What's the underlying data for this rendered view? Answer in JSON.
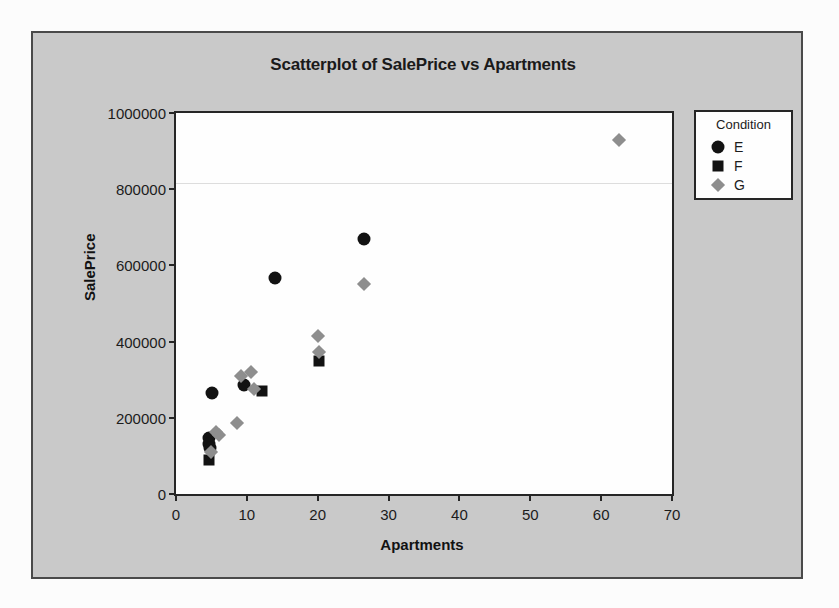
{
  "chart_data": {
    "type": "scatter",
    "title": "Scatterplot of SalePrice vs Apartments",
    "xlabel": "Apartments",
    "ylabel": "SalePrice",
    "xlim": [
      0,
      70
    ],
    "ylim": [
      0,
      1000000
    ],
    "xticks": [
      0,
      10,
      20,
      30,
      40,
      50,
      60,
      70
    ],
    "yticks": [
      0,
      200000,
      400000,
      600000,
      800000,
      1000000
    ],
    "xtick_labels": [
      "0",
      "10",
      "20",
      "30",
      "40",
      "50",
      "60",
      "70"
    ],
    "ytick_labels": [
      "0",
      "200000",
      "400000",
      "600000",
      "800000",
      "1000000"
    ],
    "grid": false,
    "legend_position": "right-outside",
    "legend_title": "Condition",
    "series": [
      {
        "name": "E",
        "marker": "circle",
        "color": "#121212",
        "points": [
          {
            "x": 4.6,
            "y": 148000
          },
          {
            "x": 4.7,
            "y": 132000
          },
          {
            "x": 4.8,
            "y": 120000
          },
          {
            "x": 5.1,
            "y": 265000
          },
          {
            "x": 9.6,
            "y": 286000
          },
          {
            "x": 14.0,
            "y": 568000
          },
          {
            "x": 26.6,
            "y": 668000
          }
        ]
      },
      {
        "name": "F",
        "marker": "square",
        "color": "#121212",
        "points": [
          {
            "x": 4.7,
            "y": 90000
          },
          {
            "x": 12.2,
            "y": 271000
          },
          {
            "x": 20.2,
            "y": 350000
          }
        ]
      },
      {
        "name": "G",
        "marker": "diamond",
        "color": "#8e8e8e",
        "points": [
          {
            "x": 5.6,
            "y": 163000
          },
          {
            "x": 6.0,
            "y": 155000
          },
          {
            "x": 4.9,
            "y": 110000
          },
          {
            "x": 8.6,
            "y": 186000
          },
          {
            "x": 9.2,
            "y": 310000
          },
          {
            "x": 10.6,
            "y": 321000
          },
          {
            "x": 11.0,
            "y": 276000
          },
          {
            "x": 20.1,
            "y": 414000
          },
          {
            "x": 20.2,
            "y": 372000
          },
          {
            "x": 26.6,
            "y": 551000
          },
          {
            "x": 62.5,
            "y": 930000
          }
        ]
      }
    ]
  },
  "legend": {
    "title": "Condition",
    "entries": [
      {
        "label": "E",
        "marker": "circle-icon",
        "color": "#121212"
      },
      {
        "label": "F",
        "marker": "square-icon",
        "color": "#121212"
      },
      {
        "label": "G",
        "marker": "diamond-icon",
        "color": "#8e8e8e"
      }
    ]
  },
  "colors": {
    "panel_background": "#c9c9c9",
    "plot_background": "#fefefe",
    "axis": "#262626",
    "series_e": "#121212",
    "series_f": "#121212",
    "series_g": "#8e8e8e"
  }
}
